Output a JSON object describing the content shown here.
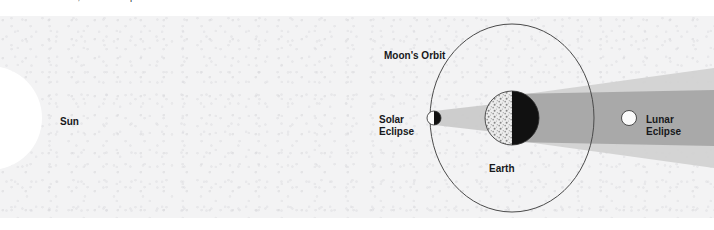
{
  "caption": "at new moon; a lunar eclipse at full moon.",
  "diagram": {
    "labels": {
      "sun": "Sun",
      "moons_orbit": "Moon's Orbit",
      "solar_eclipse": "Solar\nEclipse",
      "lunar_eclipse": "Lunar\nEclipse",
      "earth": "Earth"
    },
    "colors": {
      "panel_background": "#f3f3f4",
      "page_background": "#ffffff",
      "sun_fill": "#ffffff",
      "earth_day_side": "#e8e8e8",
      "earth_night_side": "#111111",
      "orbit_stroke": "#4a4a4a",
      "umbra": "#a8a8a8",
      "penumbra": "#cfcfcf",
      "label_text": "#17181b"
    },
    "bodies": [
      {
        "name": "sun",
        "shape": "circle",
        "cx": -10,
        "cy": 102,
        "r": 52,
        "fill": "#ffffff",
        "clipped_by_left_edge": true
      },
      {
        "name": "new-moon",
        "shape": "circle",
        "cx": 434,
        "cy": 102,
        "r": 7,
        "lit_side": "left",
        "phase": "new"
      },
      {
        "name": "earth",
        "shape": "circle",
        "cx": 512,
        "cy": 102,
        "r": 27,
        "lit_side": "left",
        "textured": true
      },
      {
        "name": "full-moon",
        "shape": "circle",
        "cx": 629,
        "cy": 102,
        "r": 7.5,
        "lit_side": "full",
        "phase": "full"
      }
    ],
    "orbit": {
      "shape": "ellipse",
      "cx": 512,
      "cy": 102,
      "rx": 82,
      "ry": 94,
      "stroke": "#4a4a4a",
      "stroke_width": 1
    },
    "shadows": [
      {
        "name": "moon-shadow-cone",
        "source": "new-moon",
        "direction": "right",
        "type": "umbra"
      },
      {
        "name": "earth-penumbra",
        "source": "earth",
        "direction": "right",
        "type": "penumbra"
      },
      {
        "name": "earth-umbra",
        "source": "earth",
        "direction": "right",
        "type": "umbra"
      }
    ]
  }
}
